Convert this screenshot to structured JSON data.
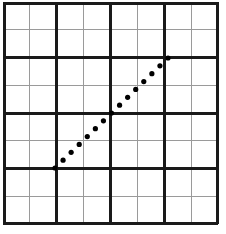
{
  "figure": {
    "width": 226,
    "height": 234,
    "background_color": "#ffffff",
    "title": ""
  },
  "grid": {
    "columns": 8,
    "rows": 8,
    "x_min": 3,
    "x_max": 218,
    "y_min": 2,
    "y_max": 224,
    "major_line_color": "#1a1a1a",
    "major_line_width": 3,
    "minor_line_color": "#9a9a9a",
    "minor_line_width": 1,
    "major_every": 2,
    "major_indices": [
      0,
      2,
      4,
      6,
      8
    ],
    "minor_indices": [
      1,
      3,
      5,
      7
    ]
  },
  "chart_data": {
    "type": "scatter",
    "title": "",
    "xlabel": "",
    "ylabel": "",
    "grid": true,
    "legend": false,
    "xlim": [
      0,
      8
    ],
    "ylim": [
      0,
      8
    ],
    "xticks": [
      0,
      1,
      2,
      3,
      4,
      5,
      6,
      7,
      8
    ],
    "yticks": [
      0,
      1,
      2,
      3,
      4,
      5,
      6,
      7,
      8
    ],
    "xtick_labels": [
      "",
      "",
      "",
      "",
      "",
      "",
      "",
      "",
      ""
    ],
    "ytick_labels": [
      "",
      "",
      "",
      "",
      "",
      "",
      "",
      "",
      ""
    ],
    "series": [
      {
        "name": "dotted-line",
        "marker": "circle",
        "marker_color": "#000000",
        "marker_size": 5.2,
        "line_style": "dotted",
        "point_count": 15,
        "endpoint_start": [
          2,
          2
        ],
        "endpoint_end": [
          6,
          6
        ],
        "slope": 1,
        "x": [
          2.0,
          2.2857,
          2.5714,
          2.8571,
          3.1429,
          3.4286,
          3.7143,
          4.0,
          4.2857,
          4.5714,
          4.8571,
          5.1429,
          5.4286,
          5.7143,
          6.0
        ],
        "y": [
          2.0,
          2.2857,
          2.5714,
          2.8571,
          3.1429,
          3.4286,
          3.7143,
          4.0,
          4.2857,
          4.5714,
          4.8571,
          5.1429,
          5.4286,
          5.7143,
          6.0
        ],
        "x_px": [
          55.0,
          63.07,
          71.14,
          79.21,
          87.29,
          95.36,
          103.43,
          111.5,
          119.57,
          127.64,
          135.71,
          143.79,
          151.86,
          159.93,
          168.0
        ],
        "y_px": [
          168.0,
          160.14,
          152.29,
          144.43,
          136.57,
          128.71,
          120.86,
          113.0,
          105.14,
          97.29,
          89.43,
          81.57,
          73.71,
          65.86,
          58.0
        ]
      }
    ],
    "annotations": []
  }
}
